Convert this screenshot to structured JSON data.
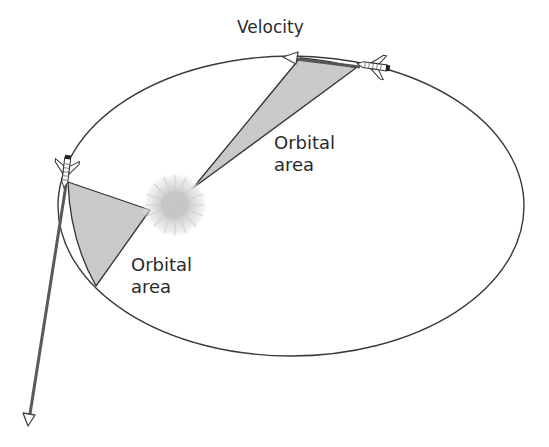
{
  "diagram": {
    "labels": {
      "velocity": "Velocity",
      "orbital_area_top": [
        "Orbital",
        "area"
      ],
      "orbital_area_left": [
        "Orbital",
        "area"
      ]
    },
    "orbit": {
      "cx": 291,
      "cy": 206,
      "rx": 233,
      "ry": 150,
      "stroke": "#3a3a3a"
    },
    "sun": {
      "cx": 175,
      "cy": 205,
      "r": 32,
      "color": "#c8c8c8"
    },
    "wedges": [
      {
        "name": "orbital-area-top",
        "fill": "#c9c9c9",
        "stroke": "#333333"
      },
      {
        "name": "orbital-area-left",
        "fill": "#c9c9c9",
        "stroke": "#333333"
      }
    ],
    "velocity_arrows": [
      {
        "name": "velocity-arrow-short",
        "from": [
          360,
          67
        ],
        "to": [
          283,
          57
        ],
        "color": "#555555"
      },
      {
        "name": "velocity-arrow-long",
        "from": [
          66,
          185
        ],
        "to": [
          28,
          425
        ],
        "color": "#555555"
      }
    ],
    "icons": {
      "shuttle": "space-shuttle-icon",
      "sun": "sun-icon",
      "arrowhead": "arrowhead-icon"
    }
  }
}
